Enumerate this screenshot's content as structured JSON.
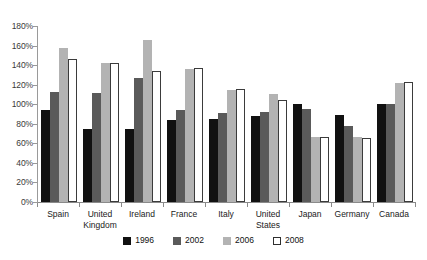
{
  "chart_data": {
    "type": "bar",
    "title": "",
    "subtitle": "",
    "xlabel": "",
    "ylabel": "",
    "ylim": [
      0,
      180
    ],
    "ytick_labels": [
      "180%",
      "160%",
      "140%",
      "120%",
      "100%",
      "80%",
      "60%",
      "40%",
      "20%",
      "0%"
    ],
    "ytick_values": [
      180,
      160,
      140,
      120,
      100,
      80,
      60,
      40,
      20,
      0
    ],
    "grid": false,
    "legend_position": "bottom",
    "categories": [
      "Spain",
      "United\nKingdom",
      "Ireland",
      "France",
      "Italy",
      "United\nStates",
      "Japan",
      "Germany",
      "Canada"
    ],
    "series": [
      {
        "name": "1996",
        "color": "#111111",
        "values": [
          94,
          75,
          75,
          84,
          85,
          88,
          100,
          89,
          100
        ]
      },
      {
        "name": "2002",
        "color": "#5a5a5a",
        "values": [
          113,
          111,
          127,
          94,
          91,
          92,
          95,
          78,
          100
        ]
      },
      {
        "name": "2006",
        "color": "#b3b3b3",
        "values": [
          158,
          142,
          166,
          136,
          115,
          110,
          67,
          66,
          122
        ]
      },
      {
        "name": "2008",
        "color": "#ffffff",
        "values": [
          146,
          142,
          134,
          137,
          116,
          104,
          66,
          65,
          123
        ]
      }
    ]
  }
}
